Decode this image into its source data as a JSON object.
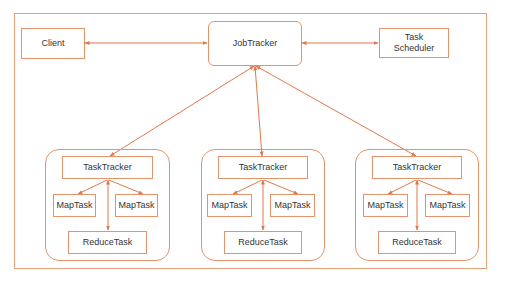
{
  "diagram": {
    "title": "",
    "colors": {
      "border": "#e5936a",
      "arrow": "#e2784a",
      "text": "#333333"
    },
    "top_row": {
      "client": {
        "label": "Client"
      },
      "job_tracker": {
        "label": "JobTracker"
      },
      "task_scheduler": {
        "label": "Task\nScheduler",
        "line1": "Task",
        "line2": "Scheduler"
      }
    },
    "groups": [
      {
        "task_tracker": "TaskTracker",
        "map_tasks": [
          "MapTask",
          "MapTask"
        ],
        "reduce_task": "ReduceTask"
      },
      {
        "task_tracker": "TaskTracker",
        "map_tasks": [
          "MapTask",
          "MapTask"
        ],
        "reduce_task": "ReduceTask"
      },
      {
        "task_tracker": "TaskTracker",
        "map_tasks": [
          "MapTask",
          "MapTask"
        ],
        "reduce_task": "ReduceTask"
      }
    ],
    "edges": [
      {
        "from": "Client",
        "to": "JobTracker",
        "type": "bidirectional"
      },
      {
        "from": "JobTracker",
        "to": "Task Scheduler",
        "type": "bidirectional"
      },
      {
        "from": "JobTracker",
        "to": "TaskTracker 1",
        "type": "bidirectional"
      },
      {
        "from": "JobTracker",
        "to": "TaskTracker 2",
        "type": "bidirectional"
      },
      {
        "from": "JobTracker",
        "to": "TaskTracker 3",
        "type": "bidirectional"
      },
      {
        "from": "TaskTracker",
        "to": "MapTask (left)",
        "type": "directed"
      },
      {
        "from": "TaskTracker",
        "to": "MapTask (right)",
        "type": "directed"
      },
      {
        "from": "TaskTracker",
        "to": "ReduceTask",
        "type": "bidirectional"
      }
    ]
  }
}
